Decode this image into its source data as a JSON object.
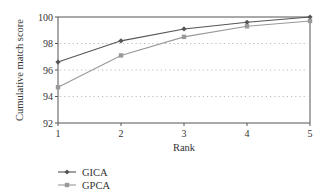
{
  "chart_data": {
    "type": "line",
    "title": "",
    "xlabel": "Rank",
    "ylabel": "Cumulative match score",
    "x": [
      1,
      2,
      3,
      4,
      5
    ],
    "xticks": [
      "1",
      "2",
      "3",
      "4",
      "5"
    ],
    "yticks": [
      "92",
      "94",
      "96",
      "98",
      "100"
    ],
    "ylim": [
      92,
      100
    ],
    "xlim": [
      1,
      5
    ],
    "grid": "horizontal dotted at 94, 96, 98",
    "legend_position": "bottom-left below axis",
    "series": [
      {
        "name": "GICA",
        "values": [
          96.6,
          98.2,
          99.1,
          99.6,
          100.0
        ],
        "color": "#555555",
        "marker": "diamond"
      },
      {
        "name": "GPCA",
        "values": [
          94.7,
          97.1,
          98.5,
          99.3,
          99.7
        ],
        "color": "#999999",
        "marker": "square"
      }
    ]
  }
}
